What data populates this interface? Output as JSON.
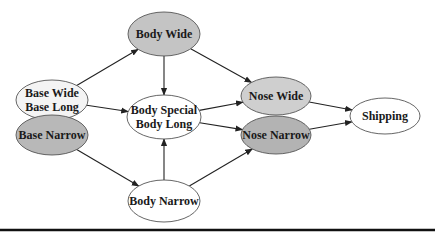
{
  "diagram": {
    "nodes": [
      {
        "id": "base_wide_long",
        "lines": [
          "Base Wide",
          "Base Long"
        ],
        "cx": 52,
        "cy": 100,
        "rx": 36,
        "ry": 20,
        "fill": "#f4f4f4"
      },
      {
        "id": "base_narrow",
        "lines": [
          "Base Narrow"
        ],
        "cx": 52,
        "cy": 135,
        "rx": 36,
        "ry": 20,
        "fill": "#b8b8b8"
      },
      {
        "id": "body_wide",
        "lines": [
          "Body Wide"
        ],
        "cx": 164,
        "cy": 34,
        "rx": 36,
        "ry": 22,
        "fill": "#c4c4c4"
      },
      {
        "id": "body_special_long",
        "lines": [
          "Body Special",
          "Body Long"
        ],
        "cx": 164,
        "cy": 117,
        "rx": 37,
        "ry": 22,
        "fill": "#ffffff"
      },
      {
        "id": "body_narrow",
        "lines": [
          "Body Narrow"
        ],
        "cx": 164,
        "cy": 201,
        "rx": 36,
        "ry": 21,
        "fill": "#ffffff"
      },
      {
        "id": "nose_wide",
        "lines": [
          "Nose Wide"
        ],
        "cx": 276,
        "cy": 96,
        "rx": 35,
        "ry": 19,
        "fill": "#cfcfcf"
      },
      {
        "id": "nose_narrow",
        "lines": [
          "Nose Narrow"
        ],
        "cx": 276,
        "cy": 135,
        "rx": 35,
        "ry": 19,
        "fill": "#b3b3b3"
      },
      {
        "id": "shipping",
        "lines": [
          "Shipping"
        ],
        "cx": 385,
        "cy": 116,
        "rx": 35,
        "ry": 18,
        "fill": "#ffffff"
      }
    ],
    "edges": [
      {
        "from": "base_wide_long",
        "to": "body_wide"
      },
      {
        "from": "base_wide_long",
        "to": "body_special_long"
      },
      {
        "from": "base_narrow",
        "to": "body_narrow"
      },
      {
        "from": "body_wide",
        "to": "body_special_long"
      },
      {
        "from": "body_wide",
        "to": "nose_wide"
      },
      {
        "from": "body_narrow",
        "to": "body_special_long"
      },
      {
        "from": "body_narrow",
        "to": "nose_narrow"
      },
      {
        "from": "body_special_long",
        "to": "nose_wide"
      },
      {
        "from": "body_special_long",
        "to": "nose_narrow"
      },
      {
        "from": "nose_wide",
        "to": "shipping"
      },
      {
        "from": "nose_narrow",
        "to": "shipping"
      }
    ],
    "bottom_rule_y": 230
  }
}
